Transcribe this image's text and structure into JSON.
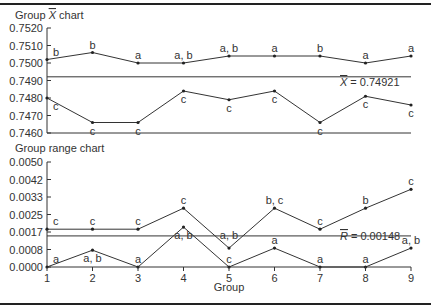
{
  "chart_data": [
    {
      "type": "line",
      "title": "Group X̅ chart",
      "xlabel": "Group",
      "ylabel": "",
      "x": [
        1,
        2,
        3,
        4,
        5,
        6,
        7,
        8,
        9
      ],
      "ylim": [
        0.746,
        0.752
      ],
      "yticks": [
        "0.7520",
        "0.7510",
        "0.7500",
        "0.7490",
        "0.7480",
        "0.7470",
        "0.7460"
      ],
      "center_line": {
        "value": 0.74921,
        "label": "X̅̅ = 0.74921"
      },
      "series": [
        {
          "name": "upper",
          "values": [
            0.7502,
            0.7506,
            0.75,
            0.75,
            0.7504,
            0.7504,
            0.7504,
            0.75,
            0.7504
          ],
          "point_labels": [
            "b",
            "b",
            "a",
            "a, b",
            "a, b",
            "a",
            "b",
            "a",
            "a"
          ]
        },
        {
          "name": "lower",
          "values": [
            0.748,
            0.7466,
            0.7466,
            0.7484,
            0.7479,
            0.7484,
            0.7466,
            0.7481,
            0.7476
          ],
          "point_labels": [
            "c",
            "c",
            "c",
            "c",
            "c",
            "c",
            "c",
            "c",
            "c"
          ]
        }
      ],
      "grid": false
    },
    {
      "type": "line",
      "title": "Group range chart",
      "xlabel": "Group",
      "ylabel": "",
      "x": [
        1,
        2,
        3,
        4,
        5,
        6,
        7,
        8,
        9
      ],
      "ylim": [
        0.0,
        0.005
      ],
      "yticks": [
        "0.0050",
        "0.0042",
        "0.0033",
        "0.0025",
        "0.0017",
        "0.0008",
        "0.0000"
      ],
      "center_line": {
        "value": 0.00148,
        "label": "R̅ = 0.00148"
      },
      "series": [
        {
          "name": "upper",
          "values": [
            0.0018,
            0.0018,
            0.0018,
            0.0028,
            0.0009,
            0.0028,
            0.0018,
            0.0028,
            0.0037
          ],
          "point_labels": [
            "c",
            "c",
            "c",
            "c",
            "a, b",
            "b, c",
            "c",
            "b",
            "c"
          ]
        },
        {
          "name": "lower",
          "values": [
            0.0,
            0.0008,
            0.0,
            0.0019,
            0.0,
            0.0009,
            0.0,
            0.0,
            0.0009
          ],
          "point_labels": [
            "a",
            "a, b",
            "a",
            "a, b",
            "c",
            "a",
            "a",
            "a",
            "a, b"
          ]
        }
      ],
      "grid": false
    }
  ],
  "xbar_chart": {
    "title_prefix": "Group ",
    "title_symbol": "X",
    "title_suffix": " chart",
    "center_label": "= 0.74921",
    "center_symbol": "X"
  },
  "range_chart": {
    "title": "Group range chart",
    "center_label": "= 0.00148",
    "center_symbol": "R"
  },
  "x_axis": {
    "label": "Group",
    "ticks": [
      "1",
      "2",
      "3",
      "4",
      "5",
      "6",
      "7",
      "8",
      "9"
    ]
  }
}
